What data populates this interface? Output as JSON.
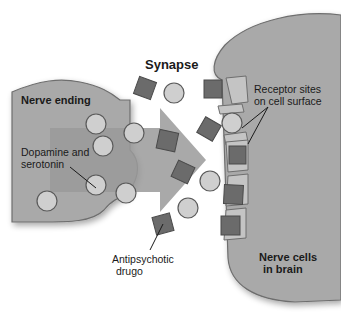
{
  "diagram": {
    "title": "Synapse",
    "labels": {
      "nerve_ending": "Nerve ending",
      "neurotransmitters_line1": "Dopamine and",
      "neurotransmitters_line2": "serotonin",
      "receptors_line1": "Receptor sites",
      "receptors_line2": "on cell surface",
      "drugs_line1": "Antipsychotic",
      "drugs_line2": "drugo",
      "target_line1": "Nerve cells",
      "target_line2": "in brain"
    },
    "colors": {
      "cell_fill": "#a9a9a9",
      "cell_stroke": "#6e6e6e",
      "arrow_fill": "#9a9a9a",
      "circle_fill": "#cfcfcf",
      "circle_stroke": "#5a5a5a",
      "square_fill": "#6b6b6b",
      "square_stroke": "#4a4a4a",
      "receptor_fill": "#c4c4c4"
    }
  }
}
